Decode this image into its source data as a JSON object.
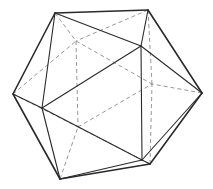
{
  "figure": {
    "colors": {
      "background": "#ffffff",
      "visible_edge": "#2a2a2a",
      "hidden_edge": "#8a8a8a"
    },
    "vertices": {
      "A": [
        55,
        13
      ],
      "B": [
        148,
        10
      ],
      "C": [
        13,
        94
      ],
      "D": [
        202,
        93
      ],
      "E": [
        60,
        179
      ],
      "F": [
        150,
        164
      ],
      "G": [
        141,
        46
      ],
      "H": [
        42,
        108
      ],
      "I": [
        142,
        160
      ],
      "J": [
        76,
        41
      ],
      "K": [
        78,
        127
      ],
      "L": [
        152,
        84
      ]
    },
    "outline_edges": [
      [
        "A",
        "B"
      ],
      [
        "B",
        "D"
      ],
      [
        "D",
        "F"
      ],
      [
        "F",
        "E"
      ],
      [
        "E",
        "C"
      ],
      [
        "C",
        "A"
      ]
    ],
    "front_edges": [
      [
        "A",
        "G"
      ],
      [
        "B",
        "G"
      ],
      [
        "G",
        "D"
      ],
      [
        "G",
        "H"
      ],
      [
        "A",
        "H"
      ],
      [
        "C",
        "H"
      ],
      [
        "H",
        "E"
      ],
      [
        "H",
        "I"
      ],
      [
        "G",
        "I"
      ],
      [
        "D",
        "I"
      ],
      [
        "I",
        "F"
      ],
      [
        "I",
        "E"
      ]
    ],
    "hidden_edges": [
      [
        "A",
        "J"
      ],
      [
        "B",
        "J"
      ],
      [
        "C",
        "J"
      ],
      [
        "J",
        "K"
      ],
      [
        "J",
        "L"
      ],
      [
        "C",
        "K"
      ],
      [
        "E",
        "K"
      ],
      [
        "K",
        "L"
      ],
      [
        "F",
        "K"
      ],
      [
        "B",
        "L"
      ],
      [
        "D",
        "L"
      ],
      [
        "F",
        "L"
      ]
    ]
  }
}
